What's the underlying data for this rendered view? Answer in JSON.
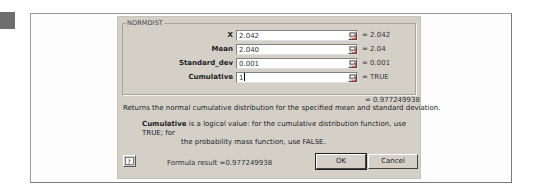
{
  "dialog": {
    "function_name": "NORMDIST",
    "arguments": [
      {
        "label": "X",
        "value": "2.042",
        "evaluated": "= 2.042"
      },
      {
        "label": "Mean",
        "value": "2.040",
        "evaluated": "= 2.04"
      },
      {
        "label": "Standard_dev",
        "value": "0.001",
        "evaluated": "= 0.001"
      },
      {
        "label": "Cumulative",
        "value": "1",
        "evaluated": "= TRUE"
      }
    ],
    "result_value": "= 0.977249938",
    "description": "Returns the normal cumulative distribution for the specified mean and standard deviation.",
    "arg_help": {
      "arg_name": "Cumulative",
      "line1": " is a logical value: for the cumulative distribution function, use TRUE; for",
      "line2": "the probability mass function, use FALSE."
    },
    "formula_result": "Formula result =0.977249938",
    "buttons": {
      "ok": "OK",
      "cancel": "Cancel"
    },
    "icons": {
      "help": "help-icon",
      "collapse": "collapse-dialog-icon"
    }
  }
}
